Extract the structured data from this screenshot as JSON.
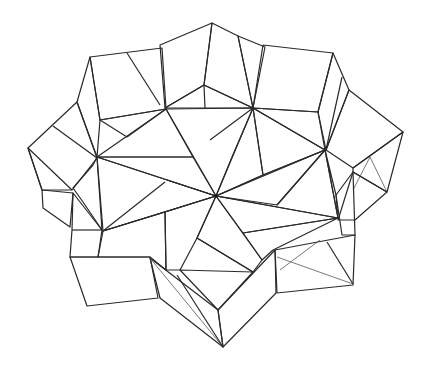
{
  "figure": {
    "title": "",
    "colors": {
      "background": "#ffffff",
      "light_face": "#e8e8e8",
      "mid_face": "#d2d2d2",
      "dark_face": "#c4c4c4",
      "edge": "#2a2a2a"
    },
    "center_point": [
      216,
      196
    ]
  }
}
